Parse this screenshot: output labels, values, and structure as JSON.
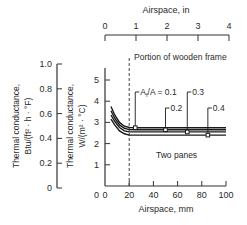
{
  "chart_data": {
    "type": "line",
    "title": "",
    "xlabel": "Airspace, mm",
    "x2label": "Airspace, in",
    "ylabel": "Thermal conductance, W/(m² · °C)",
    "y2label": "Thermal conductance, Btu/(ft² · h · °F)",
    "xlim": [
      0,
      100
    ],
    "x2lim": [
      0,
      4
    ],
    "ylim": [
      0,
      5.5
    ],
    "y2lim": [
      0,
      1.0
    ],
    "x_ticks": [
      "0",
      "20",
      "40",
      "60",
      "80",
      "100"
    ],
    "x2_ticks": [
      "0",
      "1",
      "2",
      "3",
      "4"
    ],
    "y_ticks": [
      "1",
      "2",
      "3",
      "4",
      "5"
    ],
    "y2_ticks": [
      "0",
      "0.2",
      "0.4",
      "0.6",
      "0.8",
      "1.0"
    ],
    "annotations": {
      "frame_label": "Portion of wooden frame",
      "frame_line_x": 20,
      "series_prefix": "A",
      "series_sub": "f",
      "series_suffix": "/A = 0.1",
      "region_label": "Two panes"
    },
    "x": [
      5,
      8,
      12,
      16,
      20,
      25,
      40,
      60,
      80,
      100
    ],
    "series": [
      {
        "name": "Af/A = 0.1",
        "label": "0.1",
        "values": [
          3.75,
          3.35,
          3.0,
          2.82,
          2.76,
          2.75,
          2.75,
          2.75,
          2.75,
          2.75
        ],
        "marker_x": 25
      },
      {
        "name": "Af/A = 0.2",
        "label": "0.2",
        "values": [
          3.55,
          3.2,
          2.88,
          2.72,
          2.66,
          2.65,
          2.65,
          2.65,
          2.65,
          2.65
        ],
        "marker_x": 50
      },
      {
        "name": "Af/A = 0.3",
        "label": "0.3",
        "values": [
          3.35,
          3.05,
          2.76,
          2.6,
          2.55,
          2.55,
          2.55,
          2.55,
          2.55,
          2.55
        ],
        "marker_x": 68
      },
      {
        "name": "Af/A = 0.4",
        "label": "0.4",
        "values": [
          3.15,
          2.88,
          2.6,
          2.46,
          2.4,
          2.4,
          2.4,
          2.4,
          2.4,
          2.4
        ],
        "marker_x": 85
      }
    ],
    "grid": false,
    "legend": "inline labels"
  }
}
